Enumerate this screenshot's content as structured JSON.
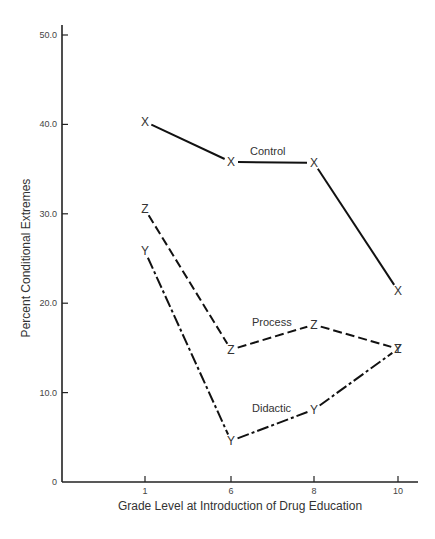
{
  "chart_data": {
    "type": "line",
    "title": "",
    "xlabel": "Grade Level at Introduction of Drug Education",
    "ylabel": "Percent Conditional Extremes",
    "x": [
      1,
      6,
      8,
      10
    ],
    "x_tick_labels": [
      "1",
      "6",
      "8",
      "10"
    ],
    "y_tick_labels": [
      "0",
      "10.0",
      "20.0",
      "30.0",
      "40.0",
      "50.0"
    ],
    "y_ticks": [
      0,
      10,
      20,
      30,
      40,
      50
    ],
    "ylim": [
      0,
      50
    ],
    "grid": false,
    "legend": "inline labels",
    "series": [
      {
        "name": "Control",
        "marker": "X",
        "style": "solid",
        "values": [
          40.3,
          35.8,
          35.7,
          21.4
        ]
      },
      {
        "name": "Process",
        "marker": "Z",
        "style": "dashed",
        "values": [
          30.5,
          14.8,
          17.6,
          14.9
        ]
      },
      {
        "name": "Didactic",
        "marker": "Y",
        "style": "dash-dot",
        "values": [
          25.8,
          4.6,
          8.1,
          14.9
        ]
      }
    ]
  }
}
